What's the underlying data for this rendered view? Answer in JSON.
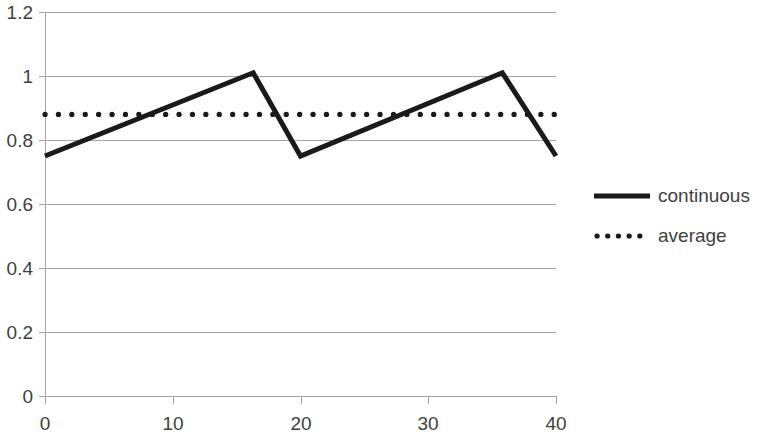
{
  "chart_data": {
    "type": "line",
    "title": "",
    "xlabel": "",
    "ylabel": "",
    "xlim": [
      0,
      40
    ],
    "ylim": [
      0,
      1.2
    ],
    "grid": true,
    "legend_position": "right",
    "x_ticks": [
      "0",
      "10",
      "20",
      "30",
      "40"
    ],
    "x_tick_values": [
      0,
      10,
      20,
      30,
      40
    ],
    "y_ticks": [
      "0",
      "0.2",
      "0.4",
      "0.6",
      "0.8",
      "1",
      "1.2"
    ],
    "y_tick_values": [
      0,
      0.2,
      0.4,
      0.6,
      0.8,
      1,
      1.2
    ],
    "series": [
      {
        "name": "continuous",
        "style": "solid",
        "color": "#1a1a1a",
        "x": [
          0,
          16.3,
          20,
          35.8,
          40
        ],
        "values": [
          0.75,
          1.01,
          0.75,
          1.01,
          0.75
        ]
      },
      {
        "name": "average",
        "style": "dotted",
        "color": "#1a1a1a",
        "x": [
          0,
          40
        ],
        "values": [
          0.88,
          0.88
        ]
      }
    ]
  },
  "legend": {
    "items": [
      {
        "label": "continuous",
        "style": "solid"
      },
      {
        "label": "average",
        "style": "dotted"
      }
    ]
  }
}
